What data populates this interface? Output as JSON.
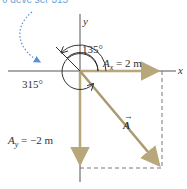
{
  "diagram": {
    "annotation": "θ deve ser 315°",
    "axes": {
      "x_label": "x",
      "y_label": "y"
    },
    "angles": {
      "wrong_angle": "135°",
      "correct_angle": "315°"
    },
    "components": {
      "ax_label": "A",
      "ax_sub": "x",
      "ax_value": "= 2 m",
      "ay_label": "A",
      "ay_sub": "y",
      "ay_value": "= −2 m"
    },
    "vector": {
      "label": "A",
      "arrow": "→"
    },
    "colors": {
      "vector": "#b7a77a",
      "axis": "#555555",
      "dotted_arc": "#5b8fd6",
      "dashed": "#666666"
    }
  }
}
